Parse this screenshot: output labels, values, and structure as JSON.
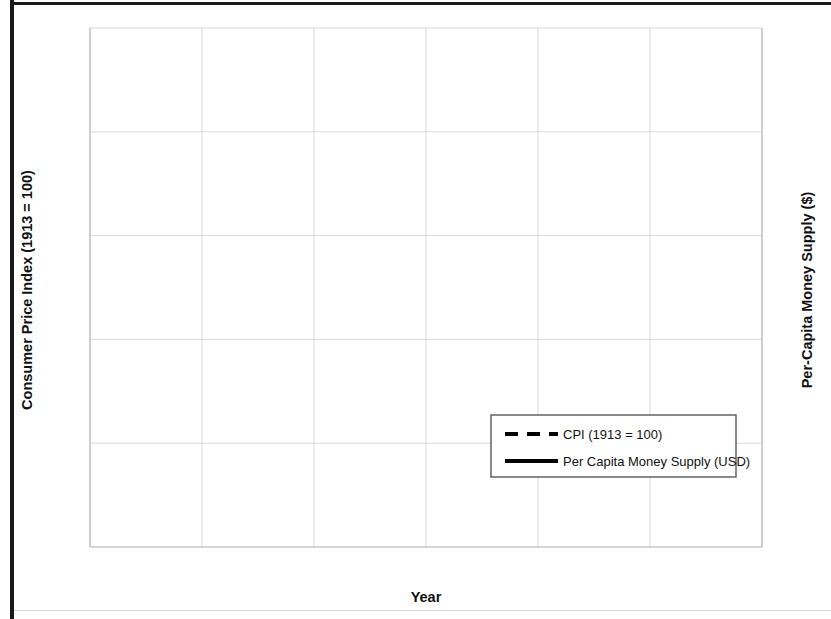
{
  "chart_data": {
    "type": "line",
    "title": "",
    "xlabel": "Year",
    "ylabel": "Consumer Price Index (1913 = 100)",
    "y2label": "Per-Capita Money Supply ($)",
    "xlim": [
      1835,
      1865
    ],
    "ylim": [
      0,
      125
    ],
    "y2lim": [
      0,
      25
    ],
    "xticks": [
      1835,
      1840,
      1845,
      1850,
      1855,
      1860,
      1865
    ],
    "xtick_labels": [
      "1835",
      "1840",
      "1845",
      "1850",
      "1855",
      "1860",
      "1865"
    ],
    "yticks": [
      0,
      25,
      50,
      75,
      100,
      125
    ],
    "ytick_labels": [
      "0",
      "25",
      "50",
      "75",
      "100",
      "125"
    ],
    "y2ticks": [
      0,
      5,
      10,
      15,
      20,
      25
    ],
    "y2tick_labels": [
      "0",
      "5",
      "10",
      "15",
      "20",
      "25"
    ],
    "grid": true,
    "legend_position": "center-right",
    "x": [
      1837,
      1838,
      1839,
      1840,
      1841,
      1842,
      1843,
      1844,
      1845,
      1846,
      1847,
      1848,
      1849,
      1850,
      1851,
      1852,
      1853,
      1854,
      1855,
      1856,
      1857,
      1858,
      1859,
      1860,
      1861,
      1862
    ],
    "series": [
      {
        "name": "CPI (1913 = 100)",
        "axis": "left",
        "style": "dashed",
        "color": "#000000",
        "values": [
          99,
          97,
          100,
          95,
          89,
          84,
          75.5,
          76,
          76,
          78,
          80.5,
          78,
          75.5,
          79,
          80,
          81,
          84,
          86,
          87.5,
          88,
          88,
          84,
          79.5,
          79,
          79,
          90.5
        ]
      },
      {
        "name": "Per Capita Money Supply (USD)",
        "axis": "right",
        "style": "solid",
        "color": "#000000",
        "values": [
          20.4,
          17.2,
          17.2,
          14.8,
          12.6,
          10.8,
          8.6,
          10.3,
          10.7,
          11.5,
          12.5,
          13.0,
          12.2,
          15.0,
          16.9,
          18.4,
          19.4,
          20.2,
          19.4,
          20.2,
          21.0,
          17.1,
          19.1,
          18.7,
          19.8,
          23.6
        ]
      }
    ],
    "legend": [
      {
        "label": "CPI (1913 = 100)",
        "style": "dashed"
      },
      {
        "label": "Per Capita Money Supply (USD)",
        "style": "solid"
      }
    ]
  },
  "axes": {
    "left_title": "Consumer Price Index (1913 = 100)",
    "right_title": "Per-Capita Money Supply ($)",
    "x_title": "Year"
  }
}
